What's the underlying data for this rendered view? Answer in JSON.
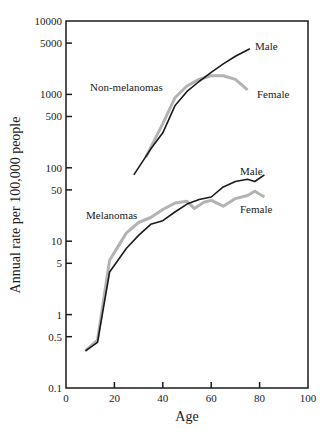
{
  "chart_data": {
    "type": "line",
    "title": "",
    "xlabel": "Age",
    "ylabel": "Annual rate per 100,000 people",
    "xlim": [
      0,
      100
    ],
    "ylim": [
      0.1,
      10000
    ],
    "yscale": "log",
    "grid": false,
    "legend": "none (inline labels)",
    "x_ticks": [
      "0",
      "20",
      "40",
      "60",
      "80",
      "100"
    ],
    "y_ticks": [
      "0.1",
      "0.5",
      "1",
      "5",
      "10",
      "50",
      "100",
      "500",
      "1000",
      "5000",
      "10000"
    ],
    "annotations": [
      "Non-melanomas",
      "Melanomas",
      "Male",
      "Female",
      "Male",
      "Female"
    ],
    "series": [
      {
        "name": "Non-melanomas Male",
        "group": "Non-melanomas",
        "color": "#1a1a1a",
        "x": [
          28,
          35,
          40,
          45,
          50,
          55,
          60,
          65,
          70,
          76
        ],
        "values": [
          80,
          180,
          300,
          700,
          1100,
          1500,
          2000,
          2600,
          3300,
          4200
        ]
      },
      {
        "name": "Non-melanomas Female",
        "group": "Non-melanomas",
        "color": "#b3b3b3",
        "x": [
          33,
          40,
          45,
          50,
          55,
          60,
          65,
          70,
          75
        ],
        "values": [
          140,
          400,
          900,
          1300,
          1600,
          1800,
          1800,
          1600,
          1150
        ]
      },
      {
        "name": "Melanomas Male",
        "group": "Melanomas",
        "color": "#1a1a1a",
        "x": [
          8,
          13,
          18,
          25,
          30,
          35,
          40,
          45,
          50,
          55,
          60,
          65,
          70,
          75,
          78,
          82
        ],
        "values": [
          0.32,
          0.42,
          3.8,
          8,
          12,
          17,
          19,
          25,
          32,
          37,
          40,
          55,
          65,
          70,
          65,
          80
        ]
      },
      {
        "name": "Melanomas Female",
        "group": "Melanomas",
        "color": "#b3b3b3",
        "x": [
          8,
          13,
          18,
          22,
          25,
          30,
          35,
          40,
          45,
          50,
          53,
          57,
          60,
          65,
          70,
          75,
          78,
          82
        ],
        "values": [
          0.32,
          0.45,
          5.5,
          9,
          13,
          18,
          21,
          27,
          33,
          35,
          28,
          34,
          36,
          30,
          38,
          42,
          48,
          40
        ]
      }
    ]
  },
  "labels": {
    "xlabel": "Age",
    "ylabel": "Annual rate per 100,000 people",
    "non_melanomas": "Non-melanomas",
    "melanomas": "Melanomas",
    "nm_male": "Male",
    "nm_female": "Female",
    "m_male": "Male",
    "m_female": "Female"
  }
}
